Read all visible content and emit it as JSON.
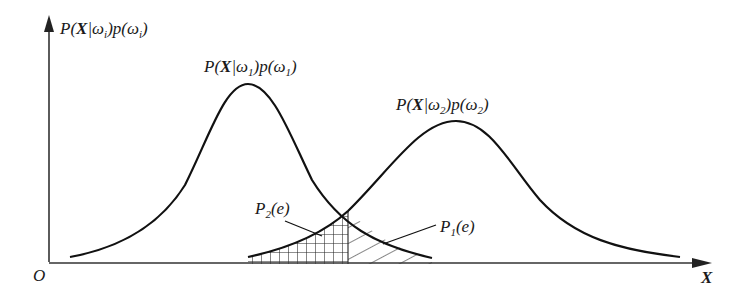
{
  "diagram": {
    "type": "bayes-decision-error-regions",
    "axes": {
      "y_label": {
        "prefix": "P(",
        "X": "X",
        "bar": "|",
        "omega": "ω",
        "sub": "i",
        "mid": ")p(",
        "omega2": "ω",
        "sub2": "i",
        "suffix": ")"
      },
      "x_label": "X",
      "origin_label": "O"
    },
    "curves": [
      {
        "name": "class-1-curve",
        "label": {
          "prefix": "P(",
          "X": "X",
          "bar": "|",
          "omega": "ω",
          "sub": "1",
          "mid": ")p(",
          "omega2": "ω",
          "sub2": "1",
          "suffix": ")"
        },
        "peak_x": 248,
        "peak_y": 84
      },
      {
        "name": "class-2-curve",
        "label": {
          "prefix": "P(",
          "X": "X",
          "bar": "|",
          "omega": "ω",
          "sub": "2",
          "mid": ")p(",
          "omega2": "ω",
          "sub2": "2",
          "suffix": ")"
        },
        "peak_x": 456,
        "peak_y": 121
      }
    ],
    "regions": [
      {
        "name": "error-region-p2",
        "label": {
          "P": "P",
          "sub": "2",
          "rest": "(e)"
        },
        "pattern": "crosshatch"
      },
      {
        "name": "error-region-p1",
        "label": {
          "P": "P",
          "sub": "1",
          "rest": "(e)"
        },
        "pattern": "diagonal-hatch"
      }
    ],
    "decision_boundary_x": 348
  }
}
